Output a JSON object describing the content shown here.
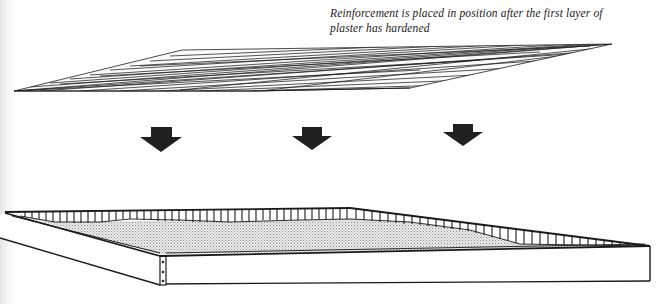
{
  "figure": {
    "caption_line1": "Reinforcement is placed in position after the first layer of",
    "caption_line2": "plaster has hardened",
    "elements": {
      "mesh": "reinforcement-mesh",
      "arrows": [
        "down-arrow",
        "down-arrow",
        "down-arrow"
      ],
      "tray": "plaster-tray"
    },
    "colors": {
      "ink": "#1a1a1a",
      "arrow_fill": "#202020",
      "plaster_stipple": "#c8c8c8",
      "background": "#ffffff"
    }
  }
}
